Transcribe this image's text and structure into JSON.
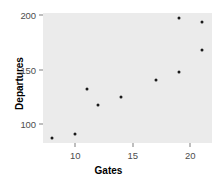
{
  "chart_data": {
    "type": "scatter",
    "title": "",
    "xlabel": "Gates",
    "ylabel": "Departures",
    "xlim": [
      7.2,
      21.9
    ],
    "ylim": [
      83,
      202
    ],
    "xticks": [
      10,
      15,
      20
    ],
    "xtick_labels": [
      "10",
      "15",
      "20"
    ],
    "yticks": [
      100,
      150,
      200
    ],
    "ytick_labels": [
      "100",
      "150",
      "200"
    ],
    "grid": false,
    "legend": null,
    "panel_background": "#ebebeb",
    "point_color": "#1a1a1a",
    "x": [
      8,
      10,
      11,
      12,
      14,
      17,
      19,
      19,
      21,
      21
    ],
    "y": [
      88,
      91,
      132,
      118,
      125,
      141,
      197,
      148,
      194,
      168
    ],
    "points": [
      {
        "x": 8,
        "y": 88
      },
      {
        "x": 10,
        "y": 91
      },
      {
        "x": 11,
        "y": 132
      },
      {
        "x": 12,
        "y": 118
      },
      {
        "x": 14,
        "y": 125
      },
      {
        "x": 17,
        "y": 141
      },
      {
        "x": 19,
        "y": 197
      },
      {
        "x": 19,
        "y": 148
      },
      {
        "x": 21,
        "y": 194
      },
      {
        "x": 21,
        "y": 168
      }
    ]
  }
}
